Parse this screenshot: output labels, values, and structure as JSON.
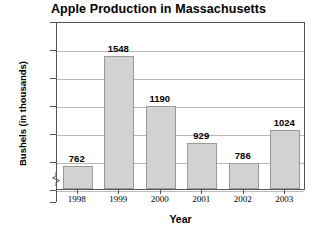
{
  "chart_data": {
    "type": "bar",
    "title": "Apple Production in Massachusetts",
    "xlabel": "Year",
    "ylabel": "Bushels (in thousands)",
    "categories": [
      "1998",
      "1999",
      "2000",
      "2001",
      "2002",
      "2003"
    ],
    "values": [
      762,
      1548,
      1190,
      929,
      786,
      1024
    ],
    "value_labels": [
      "762",
      "1548",
      "1190",
      "929",
      "786",
      "1024"
    ],
    "ylim": [
      600,
      1800
    ],
    "y_ticks": [
      "1800",
      "1600",
      "1400",
      "1200",
      "1000",
      "800",
      "600",
      "0"
    ],
    "y_tick_values": [
      1800,
      1600,
      1400,
      1200,
      1000,
      800,
      600,
      0
    ],
    "axis_break": true,
    "axis_break_between": [
      600,
      0
    ],
    "grid": "horizontal",
    "legend": "none",
    "bar_fill_color": "#d2d2d2",
    "bar_border_color": "#9a9a9a",
    "gridline_color": "#b9b9b9",
    "frame_color": "#555555",
    "background_color": "#ffffff"
  }
}
